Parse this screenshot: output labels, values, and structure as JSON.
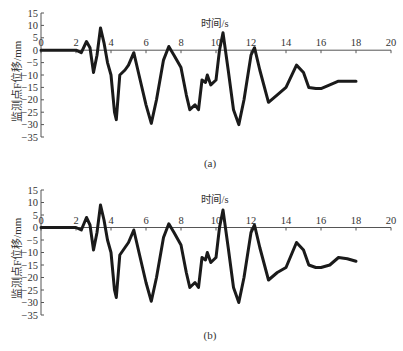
{
  "chart_data": [
    {
      "type": "line",
      "panel": "(a)",
      "caption": "(a)",
      "title": "",
      "xlabel": "时间/s",
      "ylabel": "监测点F位移/mm",
      "xlim": [
        0,
        20
      ],
      "ylim": [
        -35,
        15
      ],
      "xticks": [
        "0",
        "2",
        "4",
        "6",
        "8",
        "10",
        "12",
        "14",
        "16",
        "18",
        "20"
      ],
      "yticks": [
        "15",
        "10",
        "5",
        "0",
        "-5",
        "-10",
        "-15",
        "-20",
        "-25",
        "-30",
        "-35"
      ],
      "grid": false,
      "legend": null,
      "series": [
        {
          "name": "displacement",
          "x": [
            0,
            1,
            2,
            2.3,
            2.6,
            2.8,
            3.0,
            3.2,
            3.4,
            3.6,
            3.8,
            4.0,
            4.2,
            4.3,
            4.5,
            4.8,
            5.0,
            5.3,
            5.6,
            6.0,
            6.3,
            6.6,
            7.0,
            7.3,
            7.6,
            8.0,
            8.3,
            8.5,
            8.8,
            9.0,
            9.2,
            9.4,
            9.5,
            9.7,
            10.0,
            10.2,
            10.4,
            10.7,
            11.0,
            11.3,
            11.6,
            12.0,
            12.2,
            12.5,
            13.0,
            13.5,
            14.0,
            14.6,
            15.0,
            15.3,
            15.7,
            16.0,
            16.5,
            17.0,
            17.5,
            18.0
          ],
          "values": [
            0,
            0,
            0,
            -1,
            3.5,
            1,
            -9,
            -2,
            9,
            3,
            -5,
            -10,
            -25,
            -28,
            -10,
            -8,
            -6,
            -1,
            -10,
            -22,
            -29.5,
            -20,
            -4,
            1.5,
            -2,
            -7,
            -18,
            -24,
            -22,
            -24,
            -12,
            -13,
            -10,
            -14,
            -12,
            0,
            7,
            -8,
            -24,
            -30,
            -20,
            -2,
            1,
            -8,
            -21,
            -18,
            -15,
            -6,
            -9,
            -15,
            -15.5,
            -15.5,
            -14,
            -12.5,
            -12.5,
            -12.5
          ]
        }
      ]
    },
    {
      "type": "line",
      "panel": "(b)",
      "caption": "(b)",
      "title": "",
      "xlabel": "时间/s",
      "ylabel": "监测点F位移/mm",
      "xlim": [
        0,
        20
      ],
      "ylim": [
        -35,
        15
      ],
      "xticks": [
        "0",
        "2",
        "4",
        "6",
        "8",
        "10",
        "12",
        "14",
        "16",
        "18",
        "20"
      ],
      "yticks": [
        "15",
        "10",
        "5",
        "0",
        "-5",
        "-10",
        "-15",
        "-20",
        "-25",
        "-30",
        "-35"
      ],
      "grid": false,
      "legend": null,
      "series": [
        {
          "name": "displacement",
          "x": [
            0,
            1,
            2,
            2.3,
            2.6,
            2.8,
            3.0,
            3.2,
            3.4,
            3.6,
            3.8,
            4.0,
            4.2,
            4.3,
            4.5,
            4.8,
            5.0,
            5.3,
            5.6,
            6.0,
            6.3,
            6.6,
            7.0,
            7.3,
            7.6,
            8.0,
            8.3,
            8.5,
            8.8,
            9.0,
            9.2,
            9.4,
            9.5,
            9.7,
            10.0,
            10.2,
            10.4,
            10.7,
            11.0,
            11.3,
            11.6,
            12.0,
            12.2,
            12.5,
            13.0,
            13.5,
            14.0,
            14.6,
            15.0,
            15.3,
            15.7,
            16.0,
            16.5,
            17.0,
            17.5,
            18.0
          ],
          "values": [
            0,
            0,
            0,
            -1,
            4,
            1,
            -9,
            -2,
            9,
            3,
            -5,
            -10,
            -25,
            -28,
            -11,
            -8,
            -6,
            -1,
            -10,
            -22,
            -29.5,
            -20,
            -4,
            1.5,
            -2,
            -7,
            -18,
            -24,
            -22,
            -24,
            -12,
            -13,
            -10,
            -14,
            -12,
            0,
            7,
            -8,
            -24,
            -30,
            -20,
            -2,
            1,
            -8,
            -21,
            -18,
            -16,
            -6,
            -9,
            -15,
            -16,
            -16,
            -15,
            -12,
            -12.5,
            -13.5
          ]
        }
      ]
    }
  ]
}
